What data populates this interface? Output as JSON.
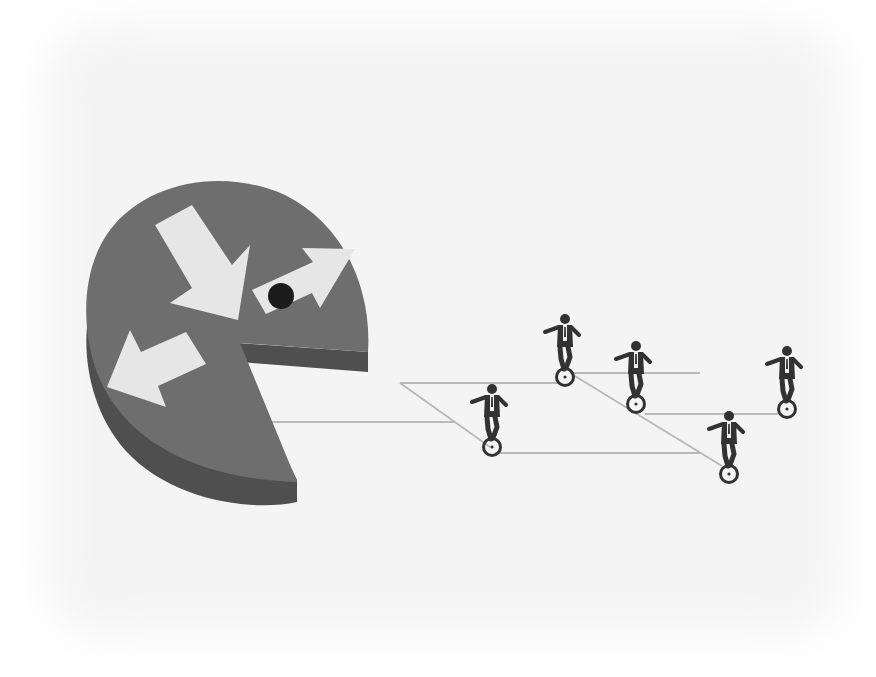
{
  "colors": {
    "page_background": "#ffffff",
    "backdrop": "#f4f4f4",
    "disc_top": "#6e6e6e",
    "disc_side": "#4f4f4f",
    "arrow": "#e6e6e6",
    "eye": "#1c1c1c",
    "line": "#b9b9b9",
    "figure": "#333333",
    "shirt": "#eeeeee"
  },
  "pacman": {
    "label": "pac-man disc",
    "eye_label": "black dot eye",
    "arrows": [
      {
        "name": "arrow-down-right",
        "points": "155,225 192,205 232,265 250,245 238,320 170,303 192,288"
      },
      {
        "name": "arrow-right-up",
        "points": "252,290 313,262 302,248 355,249 320,308 312,293 266,314"
      },
      {
        "name": "arrow-down-left",
        "points": "107,387 130,330 141,352 186,332 206,364 158,386 166,407"
      }
    ]
  },
  "lines": [
    {
      "x1": 258,
      "y1": 422,
      "x2": 455,
      "y2": 422
    },
    {
      "x1": 400,
      "y1": 383,
      "x2": 558,
      "y2": 383
    },
    {
      "x1": 400,
      "y1": 383,
      "x2": 490,
      "y2": 447
    },
    {
      "x1": 495,
      "y1": 453,
      "x2": 700,
      "y2": 453
    },
    {
      "x1": 570,
      "y1": 373,
      "x2": 700,
      "y2": 373
    },
    {
      "x1": 570,
      "y1": 373,
      "x2": 722,
      "y2": 466
    },
    {
      "x1": 645,
      "y1": 414,
      "x2": 778,
      "y2": 414
    }
  ],
  "unicyclists": [
    {
      "name": "unicyclist-1",
      "x": 492,
      "y": 447
    },
    {
      "name": "unicyclist-2",
      "x": 565,
      "y": 377
    },
    {
      "name": "unicyclist-3",
      "x": 636,
      "y": 404
    },
    {
      "name": "unicyclist-4",
      "x": 729,
      "y": 474
    },
    {
      "name": "unicyclist-5",
      "x": 787,
      "y": 409
    }
  ]
}
